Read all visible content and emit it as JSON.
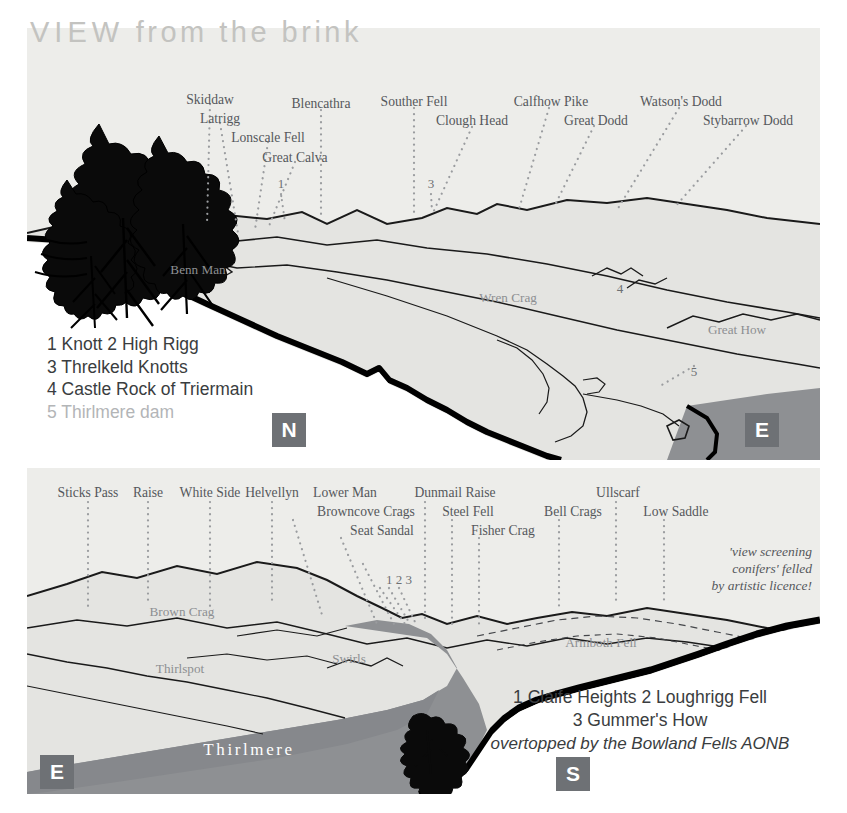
{
  "title": {
    "lead": "VIEW",
    "rest": " from the brink"
  },
  "colors": {
    "panel_bg": "#ededea",
    "label": "#55585c",
    "in_label": "#8d8f92",
    "title": "#c3c3c0",
    "badge_bg": "#6e7175",
    "water": "#8e9093",
    "water_dark": "#7e8084",
    "ridge": "#111111",
    "fill_light": "#e3e3e0"
  },
  "north_panel": {
    "compass": "N",
    "compass_right": "E",
    "skyline_labels": [
      {
        "text": "Skiddaw",
        "x": 210,
        "y": 92,
        "tip_x": 207,
        "tip_y": 225
      },
      {
        "text": "Latrigg",
        "x": 220,
        "y": 111,
        "tip_x": 238,
        "tip_y": 233
      },
      {
        "text": "Lonscale Fell",
        "x": 268,
        "y": 130,
        "tip_x": 255,
        "tip_y": 230
      },
      {
        "text": "Great Calva",
        "x": 295,
        "y": 150,
        "tip_x": 269,
        "tip_y": 226
      },
      {
        "text": "1",
        "x": 281,
        "y": 180,
        "tip_x": 285,
        "tip_y": 222
      },
      {
        "text": "Blencathra",
        "x": 321,
        "y": 98,
        "tip_x": 321,
        "tip_y": 218
      },
      {
        "text": "Souther Fell",
        "x": 414,
        "y": 96,
        "tip_x": 414,
        "tip_y": 214
      },
      {
        "text": "Clough Head",
        "x": 472,
        "y": 115,
        "tip_x": 432,
        "tip_y": 215
      },
      {
        "text": "3",
        "x": 431,
        "y": 180,
        "tip_x": 432,
        "tip_y": 212
      },
      {
        "text": "Calfhow Pike",
        "x": 549,
        "y": 96,
        "tip_x": 519,
        "tip_y": 209
      },
      {
        "text": "Great Dodd",
        "x": 594,
        "y": 114,
        "tip_x": 554,
        "tip_y": 207
      },
      {
        "text": "Watson's Dodd",
        "x": 679,
        "y": 96,
        "tip_x": 617,
        "tip_y": 210
      },
      {
        "text": "Stybarrow Dodd",
        "x": 746,
        "y": 114,
        "tip_x": 674,
        "tip_y": 208
      }
    ],
    "inner_labels": [
      {
        "text": "Benn Man",
        "x": 198,
        "y": 262
      },
      {
        "text": "Wren Crag",
        "x": 508,
        "y": 290
      },
      {
        "text": "Great How",
        "x": 737,
        "y": 322
      },
      {
        "text": "4",
        "x": 620,
        "y": 283
      },
      {
        "text": "5",
        "x": 694,
        "y": 366
      }
    ],
    "legend": [
      "1 Knott  2 High Rigg",
      "3 Threlkeld Knotts",
      "4 Castle Rock of Triermain",
      "5 Thirlmere dam"
    ],
    "legend_dim_index": 3
  },
  "south_panel": {
    "compass_left": "E",
    "compass_right": "S",
    "skyline_labels": [
      {
        "text": "Sticks Pass",
        "x": 88,
        "y": 487,
        "tip_x": 88,
        "tip_y": 610
      },
      {
        "text": "Raise",
        "x": 148,
        "y": 487,
        "tip_x": 148,
        "tip_y": 610
      },
      {
        "text": "White Side",
        "x": 210,
        "y": 487,
        "tip_x": 210,
        "tip_y": 610
      },
      {
        "text": "Helvellyn",
        "x": 272,
        "y": 487,
        "tip_x": 272,
        "tip_y": 608
      },
      {
        "text": "Lower Man",
        "x": 343,
        "y": 487,
        "tip_x": 322,
        "tip_y": 615
      },
      {
        "text": "Browncove Crags",
        "x": 364,
        "y": 506,
        "tip_x": 376,
        "tip_y": 612
      },
      {
        "text": "Seat Sandal",
        "x": 380,
        "y": 526,
        "tip_x": 395,
        "tip_y": 616
      },
      {
        "text": "1 2 3",
        "x": 398,
        "y": 575,
        "tip_x": 415,
        "tip_y": 620
      },
      {
        "text": "Dunmail Raise",
        "x": 452,
        "y": 487,
        "tip_x": 425,
        "tip_y": 618
      },
      {
        "text": "Steel Fell",
        "x": 466,
        "y": 506,
        "tip_x": 452,
        "tip_y": 620
      },
      {
        "text": "Fisher Crag",
        "x": 501,
        "y": 526,
        "tip_x": 478,
        "tip_y": 624
      },
      {
        "text": "Bell Crags",
        "x": 570,
        "y": 506,
        "tip_x": 559,
        "tip_y": 608
      },
      {
        "text": "Ullscarf",
        "x": 616,
        "y": 487,
        "tip_x": 614,
        "tip_y": 602
      },
      {
        "text": "Low Saddle",
        "x": 674,
        "y": 506,
        "tip_x": 664,
        "tip_y": 600
      }
    ],
    "inner_labels": [
      {
        "text": "Brown Crag",
        "x": 182,
        "y": 606
      },
      {
        "text": "Thirlspot",
        "x": 180,
        "y": 663
      },
      {
        "text": "Swirls",
        "x": 349,
        "y": 653
      },
      {
        "text": "Armboth Fell",
        "x": 600,
        "y": 637
      }
    ],
    "lake_label": {
      "text": "Thirlmere",
      "x": 249,
      "y": 749
    },
    "note": [
      "'view screening",
      "conifers' felled",
      "by artistic licence!"
    ],
    "legend": [
      "1 Claife Heights  2 Loughrigg Fell",
      "3 Gummer's How"
    ],
    "legend_italic": "overtopped by the Bowland Fells AONB"
  }
}
